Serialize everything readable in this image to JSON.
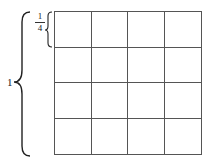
{
  "diagram": {
    "type": "unit-square-grid",
    "grid": {
      "rows": 4,
      "cols": 4
    },
    "labels": {
      "whole": "1",
      "fraction_numerator": "1",
      "fraction_denominator": "4"
    },
    "colors": {
      "line": "#555555",
      "background": "#ffffff"
    }
  }
}
